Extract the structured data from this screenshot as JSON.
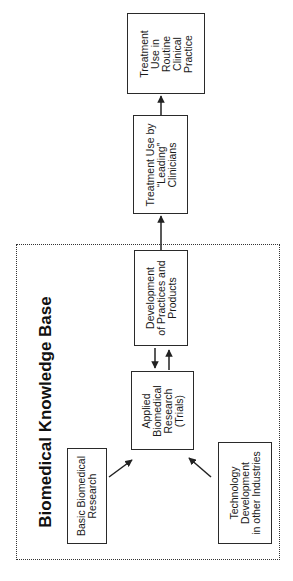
{
  "diagram": {
    "orientation": "rotated -90deg (reads bottom-to-top)",
    "group": {
      "title": "Biomedical Knowledge Base",
      "border_style": "dotted"
    },
    "nodes": {
      "basic": {
        "lines": [
          "Basic Biomedical",
          "Research"
        ]
      },
      "technology": {
        "lines": [
          "Technology",
          "Development",
          "in other Industries"
        ]
      },
      "applied": {
        "lines": [
          "Applied",
          "Biomedical",
          "Research",
          "(Trials)"
        ]
      },
      "development": {
        "lines": [
          "Development",
          "of Practices and",
          "Products"
        ]
      },
      "leading": {
        "lines": [
          "Treatment Use by",
          "“Leading”",
          "Clinicians"
        ]
      },
      "routine": {
        "lines": [
          "Treatment",
          "Use in",
          "Routine",
          "Clinical",
          "Practice"
        ]
      }
    },
    "edges": [
      {
        "from": "Basic Biomedical Research",
        "to": "Applied Biomedical Research (Trials)"
      },
      {
        "from": "Technology Development in other Industries",
        "to": "Applied Biomedical Research (Trials)"
      },
      {
        "from": "Applied Biomedical Research (Trials)",
        "to": "Development of Practices and Products"
      },
      {
        "from": "Development of Practices and Products",
        "to": "Applied Biomedical Research (Trials)"
      },
      {
        "from": "Development of Practices and Products",
        "to": "Treatment Use by “Leading” Clinicians"
      },
      {
        "from": "Treatment Use by “Leading” Clinicians",
        "to": "Treatment Use in Routine Clinical Practice"
      }
    ],
    "colors": {
      "line": "#2a2a2a",
      "background": "#ffffff"
    }
  }
}
